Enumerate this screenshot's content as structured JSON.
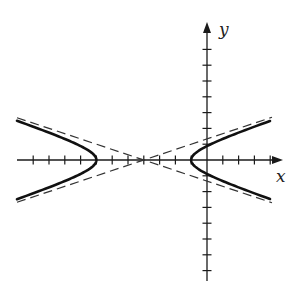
{
  "chart_data": {
    "type": "line",
    "title": "",
    "xlabel": "x",
    "ylabel": "y",
    "equation": "(x+4)^2/9 - y^2 = 1",
    "center": [
      -4,
      0
    ],
    "vertices": [
      [
        -7,
        0
      ],
      [
        -1,
        0
      ]
    ],
    "a": 3,
    "b": 1,
    "asymptotes": [
      "y = (x+4)/3",
      "y = -(x+4)/3"
    ],
    "xlim": [
      -11.8,
      4.8
    ],
    "ylim": [
      -7.5,
      8.5
    ],
    "tick_spacing": 1,
    "grid": false,
    "legend": null,
    "series": [
      {
        "name": "hyperbola-left-branch",
        "style": "solid",
        "x_range": [
          -11.8,
          -7
        ]
      },
      {
        "name": "hyperbola-right-branch",
        "style": "solid",
        "x_range": [
          -1,
          3.9
        ]
      },
      {
        "name": "asymptote-positive",
        "style": "dashed",
        "slope": 0.3333,
        "through": [
          -4,
          0
        ]
      },
      {
        "name": "asymptote-negative",
        "style": "dashed",
        "slope": -0.3333,
        "through": [
          -4,
          0
        ]
      }
    ]
  },
  "labels": {
    "x_axis": "x",
    "y_axis": "y"
  },
  "layout": {
    "origin_px": [
      207,
      160
    ],
    "unit_px": 15.8,
    "x_axis_px": [
      17,
      283
    ],
    "y_axis_px": [
      22,
      281
    ],
    "curve_x_px": [
      17,
      270
    ]
  }
}
